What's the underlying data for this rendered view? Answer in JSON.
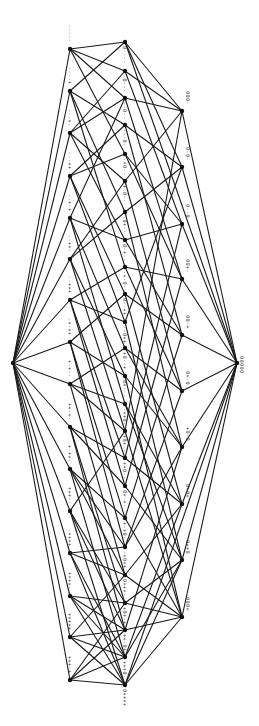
{
  "diagram": {
    "type": "hasse-lattice",
    "orientation": "rotated-90",
    "colors": {
      "edge": "#1a1a1a",
      "node": "#111111",
      "label": "#333333",
      "background": "#ffffff"
    },
    "endpoints": [
      {
        "id": "top",
        "x": 13,
        "y": 363,
        "label": ""
      },
      {
        "id": "bottom",
        "x": 237,
        "y": 363,
        "label": "00000"
      }
    ],
    "columns": {
      "left": {
        "x": 70,
        "labels": [
          "-----",
          "----+",
          "---+-",
          "---++",
          "--+-+",
          "--++-",
          "--+++",
          "-+-++",
          "+-+--",
          "++-+-",
          "+-++-",
          "+++--",
          "-++++",
          "++++-",
          "+++++",
          "+++-+"
        ],
        "y": [
          49,
          91,
          133,
          176,
          218,
          259,
          300,
          342,
          384,
          427,
          469,
          511,
          553,
          596,
          637,
          680
        ]
      },
      "middle": {
        "x": 125,
        "labels": [
          "0----",
          "-0---",
          "--0--",
          "---0-",
          "-+0--",
          "+-0--",
          "-0+--",
          "0-+--",
          "-+-0-",
          "0--++",
          "--0++",
          "+0--+",
          "0+---",
          "-++0-",
          "+0+--",
          "++0--",
          "0+-+-",
          "+-+0-",
          "-+0++",
          "0+++-",
          "+0+-+",
          "++-0+",
          "+++0-",
          "0++++"
        ],
        "y": [
          42,
          71,
          98,
          125,
          154,
          181,
          212,
          240,
          267,
          294,
          322,
          348,
          376,
          404,
          431,
          458,
          486,
          518,
          547,
          575,
          603,
          630,
          657,
          685
        ]
      },
      "right": {
        "x": 182,
        "labels": [
          "000-",
          "0-0-",
          "0--0",
          "00+-",
          "00-+",
          "0+-0",
          "+0-0",
          "0+0+",
          "0++0",
          "000+"
        ],
        "y": [
          111,
          167,
          224,
          279,
          335,
          391,
          447,
          504,
          560,
          617
        ]
      }
    },
    "edges_left_middle": [
      [
        0,
        0
      ],
      [
        0,
        1
      ],
      [
        0,
        2
      ],
      [
        0,
        4
      ],
      [
        1,
        0
      ],
      [
        1,
        3
      ],
      [
        1,
        6
      ],
      [
        1,
        8
      ],
      [
        2,
        1
      ],
      [
        2,
        2
      ],
      [
        2,
        5
      ],
      [
        2,
        7
      ],
      [
        3,
        3
      ],
      [
        3,
        4
      ],
      [
        3,
        9
      ],
      [
        3,
        10
      ],
      [
        4,
        2
      ],
      [
        4,
        7
      ],
      [
        4,
        11
      ],
      [
        4,
        13
      ],
      [
        5,
        5
      ],
      [
        5,
        6
      ],
      [
        5,
        12
      ],
      [
        5,
        14
      ],
      [
        6,
        8
      ],
      [
        6,
        10
      ],
      [
        6,
        15
      ],
      [
        6,
        16
      ],
      [
        7,
        9
      ],
      [
        7,
        12
      ],
      [
        7,
        17
      ],
      [
        7,
        18
      ],
      [
        8,
        11
      ],
      [
        8,
        13
      ],
      [
        8,
        14
      ],
      [
        8,
        19
      ],
      [
        9,
        15
      ],
      [
        9,
        16
      ],
      [
        9,
        20
      ],
      [
        9,
        21
      ],
      [
        10,
        17
      ],
      [
        10,
        18
      ],
      [
        10,
        19
      ],
      [
        10,
        22
      ],
      [
        11,
        14
      ],
      [
        11,
        20
      ],
      [
        11,
        21
      ],
      [
        11,
        23
      ],
      [
        12,
        18
      ],
      [
        12,
        19
      ],
      [
        12,
        22
      ],
      [
        12,
        23
      ],
      [
        13,
        20
      ],
      [
        13,
        21
      ],
      [
        13,
        22
      ],
      [
        13,
        23
      ],
      [
        14,
        19
      ],
      [
        14,
        21
      ],
      [
        14,
        22
      ],
      [
        14,
        23
      ],
      [
        15,
        20
      ],
      [
        15,
        21
      ],
      [
        15,
        22
      ],
      [
        15,
        23
      ]
    ],
    "edges_middle_right": [
      [
        0,
        0
      ],
      [
        0,
        1
      ],
      [
        1,
        0
      ],
      [
        1,
        2
      ],
      [
        2,
        0
      ],
      [
        2,
        3
      ],
      [
        3,
        1
      ],
      [
        3,
        4
      ],
      [
        4,
        2
      ],
      [
        4,
        3
      ],
      [
        5,
        0
      ],
      [
        5,
        5
      ],
      [
        6,
        1
      ],
      [
        6,
        6
      ],
      [
        7,
        2
      ],
      [
        7,
        4
      ],
      [
        8,
        3
      ],
      [
        8,
        5
      ],
      [
        9,
        4
      ],
      [
        9,
        7
      ],
      [
        10,
        1
      ],
      [
        10,
        8
      ],
      [
        11,
        5
      ],
      [
        11,
        6
      ],
      [
        12,
        6
      ],
      [
        12,
        9
      ],
      [
        13,
        7
      ],
      [
        13,
        8
      ],
      [
        14,
        0
      ],
      [
        14,
        9
      ],
      [
        15,
        2
      ],
      [
        15,
        7
      ],
      [
        16,
        3
      ],
      [
        16,
        8
      ],
      [
        17,
        4
      ],
      [
        17,
        9
      ],
      [
        18,
        5
      ],
      [
        18,
        6
      ],
      [
        19,
        7
      ],
      [
        19,
        9
      ],
      [
        20,
        8
      ],
      [
        20,
        9
      ],
      [
        21,
        6
      ],
      [
        21,
        9
      ],
      [
        22,
        7
      ],
      [
        22,
        8
      ],
      [
        23,
        9
      ],
      [
        23,
        8
      ]
    ]
  }
}
